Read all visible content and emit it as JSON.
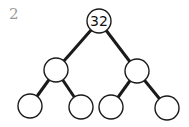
{
  "question_number": "2",
  "tree": {
    "type": "binary-tree",
    "levels": 3,
    "nodes": [
      {
        "id": "root",
        "label": "32",
        "x": 99,
        "y": 21
      },
      {
        "id": "l1-left",
        "label": "",
        "x": 56,
        "y": 70
      },
      {
        "id": "l1-right",
        "label": "",
        "x": 137,
        "y": 71
      },
      {
        "id": "l2-1",
        "label": "",
        "x": 30,
        "y": 106
      },
      {
        "id": "l2-2",
        "label": "",
        "x": 81,
        "y": 107
      },
      {
        "id": "l2-3",
        "label": "",
        "x": 111,
        "y": 107
      },
      {
        "id": "l2-4",
        "label": "",
        "x": 167,
        "y": 108
      }
    ],
    "edges": [
      [
        "root",
        "l1-left"
      ],
      [
        "root",
        "l1-right"
      ],
      [
        "l1-left",
        "l2-1"
      ],
      [
        "l1-left",
        "l2-2"
      ],
      [
        "l1-right",
        "l2-3"
      ],
      [
        "l1-right",
        "l2-4"
      ]
    ]
  }
}
